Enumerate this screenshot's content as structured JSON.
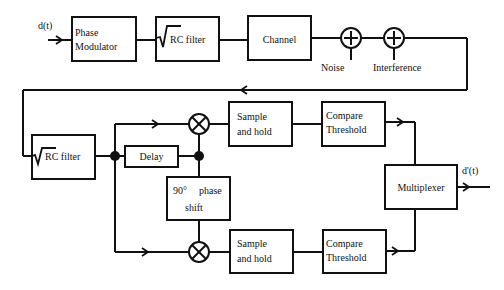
{
  "diagram": {
    "input_signal": "d(t)",
    "output_signal": "d'(t)",
    "blocks": {
      "phase_modulator": [
        "Phase",
        "Modulator"
      ],
      "tx_filter": "RC filter",
      "channel": "Channel",
      "noise": "Noise",
      "interference": "Interference",
      "rx_filter": "RC filter",
      "delay": "Delay",
      "phase_shift": [
        "90°",
        "phase",
        "shift"
      ],
      "sample_hold_top": [
        "Sample",
        "and hold"
      ],
      "sample_hold_bottom": [
        "Sample",
        "and hold"
      ],
      "compare_top": [
        "Compare",
        "Threshold"
      ],
      "compare_bottom": [
        "Compare",
        "Threshold"
      ],
      "multiplexer": "Multiplexer"
    },
    "colors": {
      "line": "#111111",
      "background": "#ffffff"
    }
  }
}
